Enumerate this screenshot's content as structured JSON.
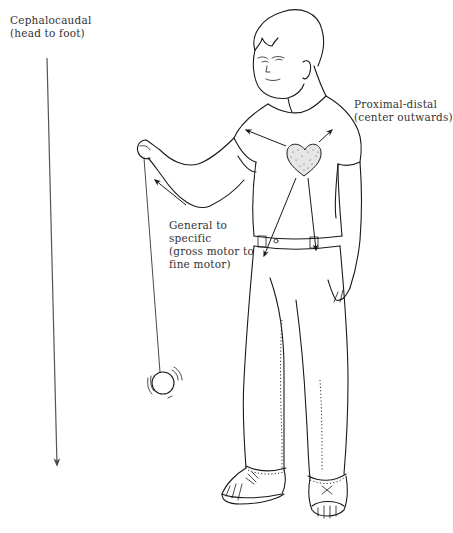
{
  "figure": {
    "colors": {
      "ink": "#1a1a1a",
      "text": "#333333",
      "background": "#ffffff",
      "heart_fill": "#e6e6e6"
    }
  },
  "labels": {
    "cephalocaudal": {
      "line1": "Cephalocaudal",
      "line2": "(head to foot)"
    },
    "proximal_distal": {
      "line1": "Proximal-distal",
      "line2": "(center outwards)"
    },
    "general_specific": {
      "line1": "General to",
      "line2": "specific",
      "line3": "(gross motor to",
      "line4": "fine motor)"
    }
  },
  "elements": {
    "cephalocaudal_arrow": "vertical arrow from head level to foot level",
    "heart_icon": "stippled heart on chest marking body center",
    "proximal_arrows": 4,
    "yoyo": "yo-yo on string with motion lines"
  }
}
